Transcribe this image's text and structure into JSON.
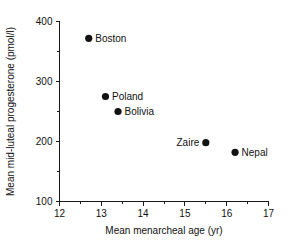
{
  "chart_data": {
    "type": "scatter",
    "title": "",
    "xlabel": "Mean menarcheal age (yr)",
    "ylabel": "Mean mid-luteal progesterone (pmol/l)",
    "xlim": [
      12,
      17
    ],
    "ylim": [
      100,
      400
    ],
    "xticks": [
      12,
      13,
      14,
      15,
      16,
      17
    ],
    "xtick_labels": [
      "12",
      "13",
      "14",
      "15",
      "16",
      "17"
    ],
    "xminor_ticks": [
      12.5,
      13.5,
      14.5,
      15.5,
      16.5
    ],
    "yticks": [
      100,
      200,
      300,
      400
    ],
    "ytick_labels": [
      "100",
      "200",
      "300",
      "400"
    ],
    "yminor_ticks": [
      150,
      250,
      350
    ],
    "grid": false,
    "legend": "none",
    "marker_color": "#121212",
    "axis_color": "#1a1a1a",
    "points": [
      {
        "label": "Boston",
        "x": 12.7,
        "y": 372,
        "label_side": "right"
      },
      {
        "label": "Poland",
        "x": 13.1,
        "y": 275,
        "label_side": "right"
      },
      {
        "label": "Bolivia",
        "x": 13.4,
        "y": 250,
        "label_side": "right"
      },
      {
        "label": "Zaire",
        "x": 15.5,
        "y": 198,
        "label_side": "left"
      },
      {
        "label": "Nepal",
        "x": 16.2,
        "y": 182,
        "label_side": "right"
      }
    ]
  }
}
